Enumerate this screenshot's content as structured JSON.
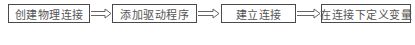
{
  "flow": {
    "steps": [
      {
        "label": "创建物理连接"
      },
      {
        "label": "添加驱动程序"
      },
      {
        "label": "建立连接"
      },
      {
        "label": "在连接下定义变量"
      }
    ],
    "arrow_style": "double-line-hollow",
    "colors": {
      "border": "#4a4a4a",
      "text": "#555555",
      "arrow": "#555555"
    }
  }
}
